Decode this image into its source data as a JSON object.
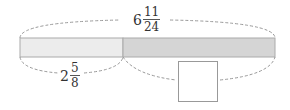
{
  "diagram": {
    "total_length": {
      "whole": "6",
      "numerator": "11",
      "denominator": "24"
    },
    "part_length": {
      "whole": "2",
      "numerator": "5",
      "denominator": "8"
    },
    "unknown_part": "",
    "colors": {
      "left_segment": "#ececec",
      "right_segment": "#d6d6d6",
      "outline": "#aaaaaa",
      "dashed": "#999999"
    }
  }
}
